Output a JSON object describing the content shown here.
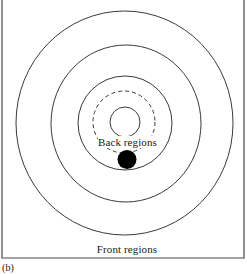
{
  "figure": {
    "panel_label": "(b)",
    "labels": {
      "inner": "Back regions",
      "outer": "Front regions"
    },
    "rings": [
      {
        "name": "outer-ring",
        "style": "solid"
      },
      {
        "name": "second-ring",
        "style": "solid"
      },
      {
        "name": "third-ring",
        "style": "solid"
      },
      {
        "name": "back-region-boundary",
        "style": "dashed"
      },
      {
        "name": "innermost-ring",
        "style": "solid"
      }
    ],
    "marker": {
      "name": "black-dot",
      "color": "#000000"
    },
    "colors": {
      "line": "#3a3a3a",
      "background": "#ffffff",
      "marker": "#000000"
    }
  }
}
